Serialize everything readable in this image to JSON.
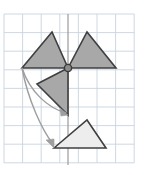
{
  "figure": {
    "canvas": {
      "width": 147,
      "height": 175,
      "background": "#ffffff"
    },
    "grid": {
      "name": "coordinate-grid",
      "x_start": 4,
      "y_start": 14,
      "cell_size": 18.6,
      "columns": 7,
      "rows": 8,
      "line_color": "#c8d4e0",
      "line_width": 0.9,
      "border_color": "#c8d4e0"
    },
    "axis_line": {
      "name": "vertical-axis",
      "x": 68,
      "y1": 14,
      "y2": 165,
      "color": "#9a9a9a",
      "width": 1.2
    },
    "center_point": {
      "name": "rotation-center-point",
      "x": 68,
      "y": 68,
      "radius": 3.6,
      "fill": "#8c8c8c",
      "stroke": "#3a3a3a"
    },
    "colors": {
      "shape_fill_dark": "#a8a8a8",
      "shape_fill_light": "#ededed",
      "shape_stroke": "#3f3f3f",
      "arrow_color": "#9e9e9e",
      "grid": "#c8d4e0"
    },
    "shapes": [
      {
        "name": "triangle-upper-left",
        "label": "Triangle A",
        "points": "22,68 52,32 68,68",
        "fill": "#a8a8a8",
        "stroke": "#3f3f3f",
        "stroke_width": 1.6
      },
      {
        "name": "triangle-upper-right",
        "label": "Triangle B",
        "points": "68,68 87,32 116,68",
        "fill": "#a8a8a8",
        "stroke": "#3f3f3f",
        "stroke_width": 1.6
      },
      {
        "name": "triangle-middle-left",
        "label": "Triangle C",
        "points": "68,68 37,84 68,115",
        "fill": "#a8a8a8",
        "stroke": "#3f3f3f",
        "stroke_width": 1.6
      },
      {
        "name": "triangle-lower-right",
        "label": "Triangle D",
        "points": "54,148 87,120 106,148",
        "fill": "#ededed",
        "stroke": "#3f3f3f",
        "stroke_width": 1.6
      }
    ],
    "arrows": [
      {
        "name": "arrow-rotation-short",
        "path": "M 22,68 C 30,92 48,108 66,113",
        "color": "#9e9e9e",
        "width": 1.4,
        "head": "68,115 60,108 61,116"
      },
      {
        "name": "arrow-rotation-long",
        "path": "M 22,68 C 28,100 42,130 53,144",
        "color": "#9e9e9e",
        "width": 1.4,
        "head": "54,148 46,140 54,139"
      }
    ]
  }
}
